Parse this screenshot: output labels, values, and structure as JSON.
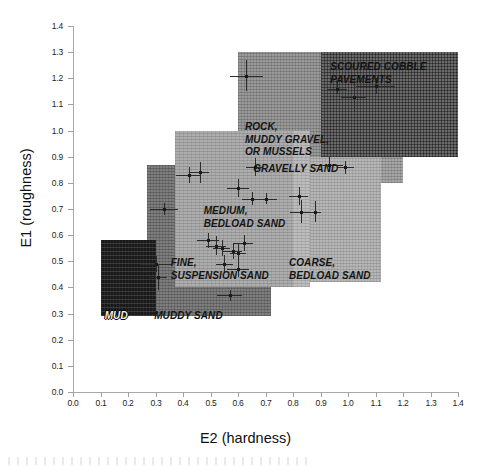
{
  "chart_data": {
    "type": "scatter",
    "title": "",
    "xlabel": "E2 (hardness)",
    "ylabel": "E1 (roughness)",
    "xlim": [
      0.0,
      1.4
    ],
    "ylim": [
      0.0,
      1.4
    ],
    "xticks": [
      "0.0",
      "0.1",
      "0.2",
      "0.3",
      "0.4",
      "0.5",
      "0.6",
      "0.7",
      "0.8",
      "0.9",
      "1.0",
      "1.1",
      "1.2",
      "1.3",
      "1.4"
    ],
    "yticks": [
      "0.0",
      "0.1",
      "0.2",
      "0.3",
      "0.4",
      "0.5",
      "0.6",
      "0.7",
      "0.8",
      "0.9",
      "1.0",
      "1.1",
      "1.2",
      "1.3",
      "1.4"
    ],
    "xtick_values": [
      0.0,
      0.1,
      0.2,
      0.3,
      0.4,
      0.5,
      0.6,
      0.7,
      0.8,
      0.9,
      1.0,
      1.1,
      1.2,
      1.3,
      1.4
    ],
    "ytick_values": [
      0.0,
      0.1,
      0.2,
      0.3,
      0.4,
      0.5,
      0.6,
      0.7,
      0.8,
      0.9,
      1.0,
      1.1,
      1.2,
      1.3,
      1.4
    ],
    "grid": false,
    "legend": "none",
    "regions": [
      {
        "name": "mud",
        "label": "MUD",
        "x0": 0.1,
        "x1": 0.3,
        "y0": 0.29,
        "y1": 0.58,
        "shade": "#1a1a1a",
        "label_style": "light"
      },
      {
        "name": "muddy-sand",
        "label": "MUDDY SAND",
        "x0": 0.27,
        "x1": 0.72,
        "y0": 0.29,
        "y1": 0.87,
        "shade": "#7e7e7e",
        "label_style": "dark"
      },
      {
        "name": "fine-suspension-sand",
        "label": "FINE,\nSUSPENSION SAND",
        "x0": 0.37,
        "x1": 0.8,
        "y0": 0.4,
        "y1": 1.0,
        "shade": "#adadad",
        "label_style": "dark"
      },
      {
        "name": "medium-bedload-sand",
        "label": "MEDIUM,\nBEDLOAD SAND",
        "x0": 0.42,
        "x1": 0.86,
        "y0": 0.4,
        "y1": 1.0,
        "shade": "#bcbcbc",
        "label_style": "dark"
      },
      {
        "name": "coarse-bedload-sand",
        "label": "COARSE,\nBEDLOAD SAND",
        "x0": 0.62,
        "x1": 1.12,
        "y0": 0.42,
        "y1": 0.9,
        "shade": "#b6b6b6",
        "label_style": "dark"
      },
      {
        "name": "gravelly-sand",
        "label": "GRAVELLY SAND",
        "x0": 0.62,
        "x1": 1.2,
        "y0": 0.8,
        "y1": 0.9,
        "shade": "#a6a6a6",
        "label_style": "dark"
      },
      {
        "name": "rock-muddy-gravel-or-mussels",
        "label": "ROCK,\nMUDDY GRAVEL,\nOR MUSSELS",
        "x0": 0.6,
        "x1": 1.08,
        "y0": 0.8,
        "y1": 1.3,
        "shade": "#9a9a9a",
        "label_style": "dark"
      },
      {
        "name": "scoured-cobble-pavements",
        "label": "SCOURED COBBLE\nPAVEMENTS",
        "x0": 0.9,
        "x1": 1.4,
        "y0": 0.9,
        "y1": 1.3,
        "shade": "#6a6a6a",
        "label_style": "dark"
      }
    ],
    "samples": [
      {
        "x": 0.3,
        "y": 0.49,
        "xerr": 0.055,
        "yerr": 0.03
      },
      {
        "x": 0.31,
        "y": 0.44,
        "xerr": 0.03,
        "yerr": 0.05
      },
      {
        "x": 0.33,
        "y": 0.7,
        "xerr": 0.05,
        "yerr": 0.022
      },
      {
        "x": 0.42,
        "y": 0.83,
        "xerr": 0.045,
        "yerr": 0.03
      },
      {
        "x": 0.46,
        "y": 0.84,
        "xerr": 0.035,
        "yerr": 0.04
      },
      {
        "x": 0.49,
        "y": 0.58,
        "xerr": 0.04,
        "yerr": 0.03
      },
      {
        "x": 0.52,
        "y": 0.56,
        "xerr": 0.035,
        "yerr": 0.035
      },
      {
        "x": 0.54,
        "y": 0.55,
        "xerr": 0.03,
        "yerr": 0.03
      },
      {
        "x": 0.55,
        "y": 0.49,
        "xerr": 0.03,
        "yerr": 0.035
      },
      {
        "x": 0.58,
        "y": 0.54,
        "xerr": 0.035,
        "yerr": 0.03
      },
      {
        "x": 0.6,
        "y": 0.47,
        "xerr": 0.04,
        "yerr": 0.03
      },
      {
        "x": 0.6,
        "y": 0.53,
        "xerr": 0.03,
        "yerr": 0.04
      },
      {
        "x": 0.62,
        "y": 0.57,
        "xerr": 0.035,
        "yerr": 0.03
      },
      {
        "x": 0.57,
        "y": 0.37,
        "xerr": 0.045,
        "yerr": 0.022
      },
      {
        "x": 0.6,
        "y": 0.78,
        "xerr": 0.04,
        "yerr": 0.035
      },
      {
        "x": 0.65,
        "y": 0.74,
        "xerr": 0.035,
        "yerr": 0.025
      },
      {
        "x": 0.7,
        "y": 0.74,
        "xerr": 0.04,
        "yerr": 0.022
      },
      {
        "x": 0.66,
        "y": 0.86,
        "xerr": 0.03,
        "yerr": 0.035
      },
      {
        "x": 0.63,
        "y": 1.21,
        "xerr": 0.06,
        "yerr": 0.06
      },
      {
        "x": 0.82,
        "y": 0.75,
        "xerr": 0.035,
        "yerr": 0.035
      },
      {
        "x": 0.83,
        "y": 0.69,
        "xerr": 0.04,
        "yerr": 0.045
      },
      {
        "x": 0.88,
        "y": 0.69,
        "xerr": 0.022,
        "yerr": 0.04
      },
      {
        "x": 0.93,
        "y": 0.87,
        "xerr": 0.05,
        "yerr": 0.03
      },
      {
        "x": 0.99,
        "y": 0.86,
        "xerr": 0.03,
        "yerr": 0.025
      },
      {
        "x": 1.02,
        "y": 1.13,
        "xerr": 0.045,
        "yerr": 0.06
      },
      {
        "x": 0.96,
        "y": 1.16,
        "xerr": 0.035,
        "yerr": 0.022
      },
      {
        "x": 1.1,
        "y": 1.17,
        "xerr": 0.07,
        "yerr": 0.03
      }
    ]
  },
  "axes": {
    "x_title": "E2 (hardness)",
    "y_title": "E1 (roughness)"
  }
}
